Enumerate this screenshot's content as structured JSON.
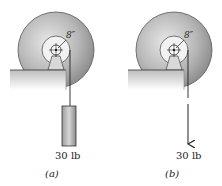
{
  "figures": [
    {
      "id": "a",
      "caption": "(a)",
      "dimension": "8″",
      "load_label": "30 lb",
      "load_type": "hanging-weight"
    },
    {
      "id": "b",
      "caption": "(b)",
      "dimension": "8″",
      "load_label": "30 lb",
      "load_type": "applied-force-arrow"
    }
  ]
}
